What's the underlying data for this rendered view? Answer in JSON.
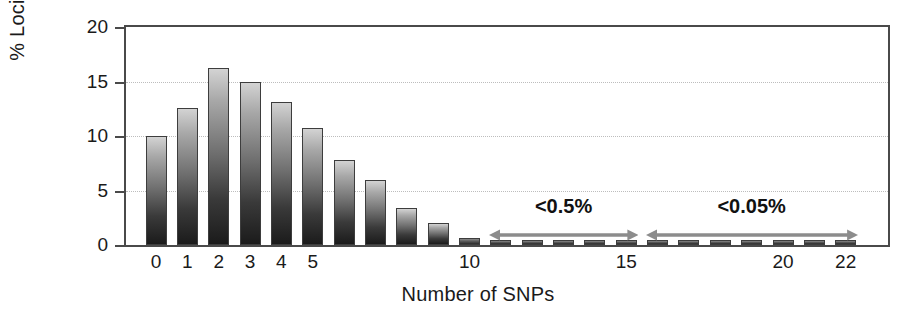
{
  "chart_data": {
    "type": "bar",
    "title": "",
    "xlabel": "Number of SNPs",
    "ylabel": "% Loci",
    "categories": [
      "0",
      "1",
      "2",
      "3",
      "4",
      "5",
      "6",
      "7",
      "8",
      "9",
      "10",
      "11",
      "12",
      "13",
      "14",
      "15",
      "16",
      "17",
      "18",
      "19",
      "20",
      "21",
      "22"
    ],
    "values": [
      10.0,
      12.6,
      16.2,
      15.0,
      13.1,
      10.7,
      7.8,
      6.0,
      3.4,
      2.0,
      0.6,
      0.25,
      0.25,
      0.25,
      0.25,
      0.25,
      0.2,
      0.2,
      0.2,
      0.2,
      0.2,
      0.2,
      0.2
    ],
    "xlim": [
      -0.5,
      23.0
    ],
    "ylim": [
      0,
      20
    ],
    "yticks": [
      0,
      5,
      10,
      15,
      20
    ],
    "ytick_labels": [
      "0",
      "5",
      "10",
      "15",
      "20"
    ],
    "xtick_labels_shown": [
      "0",
      "1",
      "2",
      "3",
      "4",
      "5",
      "10",
      "15",
      "20",
      "22"
    ],
    "xtick_label_categories": [
      0,
      1,
      2,
      3,
      4,
      5,
      10,
      15,
      20,
      22
    ],
    "grid": "horizontal-dotted",
    "legend": "none",
    "bar_fill": "gradient light-gray to black",
    "annotations": [
      {
        "text": "<0.5%",
        "span_from": 11,
        "span_to": 15,
        "arrow": "double-headed"
      },
      {
        "text": "<0.05%",
        "span_from": 16,
        "span_to": 22,
        "arrow": "double-headed"
      }
    ],
    "colors": {
      "axis": "#4a4a4a",
      "grid": "#bdbdbd",
      "text": "#1a1a1a",
      "annotation_arrow": "#8c8c8c",
      "bar_top": "#d3d3d3",
      "bar_bottom": "#1b1b1b"
    }
  },
  "axis": {
    "y_title": "% Loci",
    "x_title": "Number of SNPs"
  },
  "annotations": {
    "low_label": "<0.5%",
    "verylow_label": "<0.05%"
  }
}
